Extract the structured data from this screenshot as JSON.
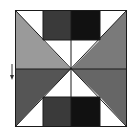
{
  "diagram": {
    "colors": {
      "background": "#ffffff",
      "outline": "#1a1a1a",
      "light_gray": "#9a9a9a",
      "mid_gray": "#707070",
      "dark_gray": "#3a3a3a",
      "black": "#111111",
      "white": "#ffffff"
    },
    "bounds": {
      "left": 15,
      "top": 10,
      "right": 127,
      "bottom": 127
    },
    "center": {
      "x": 71,
      "y": 69
    },
    "inner_columns": {
      "left": 43,
      "right": 100
    },
    "rect_rows": {
      "top_bottom": 40,
      "bottom_top": 97
    },
    "arrow": {
      "direction": "down",
      "x": 12,
      "y_start": 64,
      "y_end": 80
    }
  }
}
